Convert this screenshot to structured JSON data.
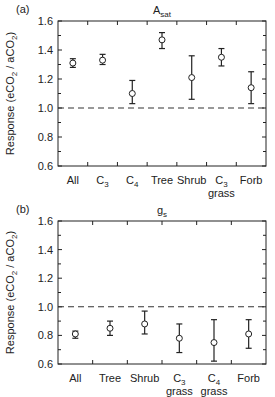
{
  "chart_data": [
    {
      "type": "scatter",
      "panel_label": "(a)",
      "title": "A_sat",
      "title_main": "A",
      "title_sub": "sat",
      "xlabel": "",
      "ylabel": "Response (eCO2 / aCO2)",
      "ylim": [
        0.6,
        1.6
      ],
      "yticks": [
        0.6,
        0.8,
        1.0,
        1.2,
        1.4,
        1.6
      ],
      "ytick_labels": [
        "0.6",
        "0.8",
        "1.0",
        "1.2",
        "1.4",
        "1.6"
      ],
      "reference_line": 1.0,
      "reference_line_style": "dashed",
      "grid": false,
      "categories": [
        "All",
        "C3",
        "C4",
        "Tree",
        "Shrub",
        "C3 grass",
        "Forb"
      ],
      "category_labels": [
        {
          "main": "All",
          "sub": "",
          "line2": ""
        },
        {
          "main": "C",
          "sub": "3",
          "line2": ""
        },
        {
          "main": "C",
          "sub": "4",
          "line2": ""
        },
        {
          "main": "Tree",
          "sub": "",
          "line2": ""
        },
        {
          "main": "Shrub",
          "sub": "",
          "line2": ""
        },
        {
          "main": "C",
          "sub": "3",
          "line2": "grass"
        },
        {
          "main": "Forb",
          "sub": "",
          "line2": ""
        }
      ],
      "values": [
        1.31,
        1.33,
        1.1,
        1.47,
        1.21,
        1.35,
        1.14
      ],
      "error_low": [
        1.28,
        1.3,
        1.03,
        1.41,
        1.06,
        1.29,
        1.03
      ],
      "error_high": [
        1.34,
        1.37,
        1.19,
        1.52,
        1.36,
        1.41,
        1.25
      ]
    },
    {
      "type": "scatter",
      "panel_label": "(b)",
      "title": "g_s",
      "title_main": "g",
      "title_sub": "s",
      "xlabel": "",
      "ylabel": "Response (eCO2 / aCO2)",
      "ylim": [
        0.6,
        1.6
      ],
      "yticks": [
        0.6,
        0.8,
        1.0,
        1.2,
        1.4,
        1.6
      ],
      "ytick_labels": [
        "0.6",
        "0.8",
        "1.0",
        "1.2",
        "1.4",
        "1.6"
      ],
      "reference_line": 1.0,
      "reference_line_style": "dashed",
      "grid": false,
      "categories": [
        "All",
        "Tree",
        "Shrub",
        "C3 grass",
        "C4 grass",
        "Forb"
      ],
      "category_labels": [
        {
          "main": "All",
          "sub": "",
          "line2": ""
        },
        {
          "main": "Tree",
          "sub": "",
          "line2": ""
        },
        {
          "main": "Shrub",
          "sub": "",
          "line2": ""
        },
        {
          "main": "C",
          "sub": "3",
          "line2": "grass"
        },
        {
          "main": "C",
          "sub": "4",
          "line2": "grass"
        },
        {
          "main": "Forb",
          "sub": "",
          "line2": ""
        }
      ],
      "values": [
        0.81,
        0.85,
        0.88,
        0.78,
        0.75,
        0.81
      ],
      "error_low": [
        0.78,
        0.8,
        0.81,
        0.68,
        0.62,
        0.71
      ],
      "error_high": [
        0.83,
        0.9,
        0.97,
        0.88,
        0.91,
        0.91
      ]
    }
  ],
  "axis": {
    "ylabel_main": "Response (eCO",
    "ylabel_sub1": "2",
    "ylabel_mid": " / aCO",
    "ylabel_sub2": "2",
    "ylabel_end": ")"
  },
  "colors": {
    "ink": "#222222",
    "dashed_line": "#333333",
    "marker_fill": "#ffffff"
  }
}
